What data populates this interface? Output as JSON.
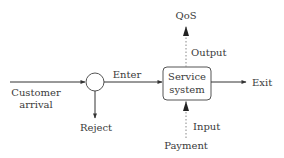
{
  "diagram": {
    "type": "flow",
    "nodes": {
      "decision": {
        "shape": "circle"
      },
      "service_system": {
        "line1": "Service",
        "line2": "system"
      }
    },
    "labels": {
      "customer_arrival_1": "Customer",
      "customer_arrival_2": "arrival",
      "enter": "Enter",
      "reject": "Reject",
      "exit": "Exit",
      "qos": "QoS",
      "output": "Output",
      "input": "Input",
      "payment": "Payment"
    },
    "colors": {
      "line": "#333333",
      "text": "#3a3a3a",
      "dotted": "#888888"
    }
  }
}
